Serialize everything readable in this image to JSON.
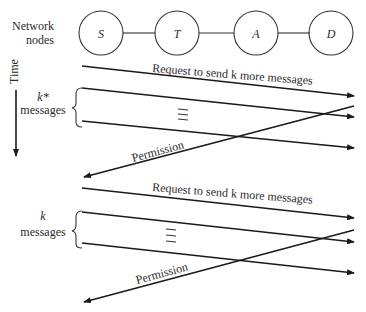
{
  "left_labels": {
    "network_nodes_line1": "Network",
    "network_nodes_line2": "nodes",
    "time": "Time",
    "group1_line1": "k*",
    "group1_line2": "messages",
    "group2_line1": "k",
    "group2_line2": "messages"
  },
  "nodes": [
    {
      "label": "S"
    },
    {
      "label": "T"
    },
    {
      "label": "A"
    },
    {
      "label": "D"
    }
  ],
  "arrows": {
    "request1": "Request to send k more messages",
    "permission1": "Permission",
    "request2": "Request to send k more messages",
    "permission2": "Permission"
  },
  "colors": {
    "ink": "#1a1a1a",
    "background": "#ffffff"
  }
}
